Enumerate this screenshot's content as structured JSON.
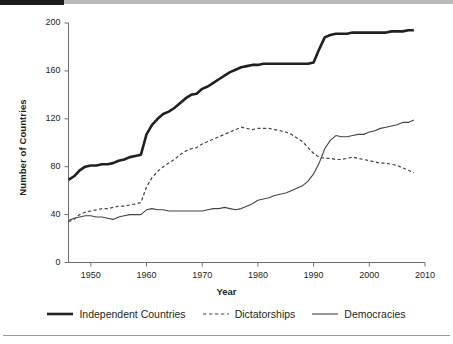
{
  "chart_data": {
    "type": "line",
    "title": "",
    "subtitle": "",
    "xlabel": "Year",
    "ylabel": "Number of Countries",
    "xlim": [
      1946,
      2008
    ],
    "ylim": [
      0,
      200
    ],
    "xticks": [
      1950,
      1960,
      1970,
      1980,
      1990,
      2000,
      2010
    ],
    "yticks": [
      0,
      40,
      80,
      120,
      160,
      200
    ],
    "grid": false,
    "legend_position": "bottom",
    "x": [
      1946,
      1947,
      1948,
      1949,
      1950,
      1951,
      1952,
      1953,
      1954,
      1955,
      1956,
      1957,
      1958,
      1959,
      1960,
      1961,
      1962,
      1963,
      1964,
      1965,
      1966,
      1967,
      1968,
      1969,
      1970,
      1971,
      1972,
      1973,
      1974,
      1975,
      1976,
      1977,
      1978,
      1979,
      1980,
      1981,
      1982,
      1983,
      1984,
      1985,
      1986,
      1987,
      1988,
      1989,
      1990,
      1991,
      1992,
      1993,
      1994,
      1995,
      1996,
      1997,
      1998,
      1999,
      2000,
      2001,
      2002,
      2003,
      2004,
      2005,
      2006,
      2007,
      2008
    ],
    "series": [
      {
        "name": "Independent Countries",
        "style": "solid-thick",
        "color": "#231f20",
        "values": [
          69,
          72,
          77,
          80,
          81,
          81,
          82,
          82,
          83,
          85,
          86,
          88,
          89,
          90,
          107,
          115,
          120,
          124,
          126,
          129,
          133,
          137,
          140,
          141,
          145,
          147,
          150,
          153,
          156,
          159,
          161,
          163,
          164,
          165,
          165,
          166,
          166,
          166,
          166,
          166,
          166,
          166,
          166,
          166,
          167,
          178,
          188,
          190,
          191,
          191,
          191,
          192,
          192,
          192,
          192,
          192,
          192,
          192,
          193,
          193,
          193,
          194,
          194
        ]
      },
      {
        "name": "Dictatorships",
        "style": "dashed",
        "color": "#444444",
        "values": [
          34,
          36,
          40,
          42,
          43,
          44,
          45,
          45,
          46,
          47,
          47,
          48,
          49,
          50,
          63,
          71,
          76,
          80,
          83,
          86,
          90,
          93,
          95,
          96,
          99,
          101,
          103,
          105,
          107,
          109,
          111,
          113,
          112,
          111,
          112,
          112,
          112,
          111,
          110,
          109,
          107,
          104,
          101,
          96,
          91,
          88,
          87,
          87,
          86,
          86,
          87,
          88,
          87,
          86,
          85,
          84,
          83,
          83,
          82,
          81,
          79,
          77,
          75
        ]
      },
      {
        "name": "Democracies",
        "style": "solid-thin",
        "color": "#444444",
        "values": [
          35,
          37,
          38,
          39,
          39,
          38,
          38,
          37,
          36,
          38,
          39,
          40,
          40,
          40,
          44,
          45,
          44,
          44,
          43,
          43,
          43,
          43,
          43,
          43,
          43,
          44,
          45,
          45,
          46,
          45,
          44,
          45,
          47,
          49,
          52,
          53,
          54,
          56,
          57,
          58,
          60,
          62,
          64,
          68,
          74,
          83,
          95,
          102,
          106,
          105,
          105,
          106,
          107,
          107,
          109,
          110,
          112,
          113,
          114,
          115,
          117,
          117,
          119
        ]
      }
    ]
  },
  "legend": {
    "items": [
      {
        "label": "Independent Countries",
        "style": "solid-thick"
      },
      {
        "label": "Dictatorships",
        "style": "dashed"
      },
      {
        "label": "Democracies",
        "style": "solid-thin"
      }
    ]
  },
  "axes": {
    "y_tick_labels": [
      "200",
      "160",
      "120",
      "80",
      "40",
      "0"
    ],
    "x_tick_labels": [
      "1950",
      "1960",
      "1970",
      "1980",
      "1990",
      "2000",
      "2010"
    ],
    "y_axis_title": "Number of Countries",
    "x_axis_title": "Year"
  }
}
